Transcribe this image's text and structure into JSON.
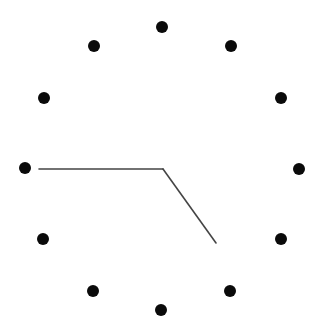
{
  "clock": {
    "description": "Analog clock face with 12 hour dots and two hands",
    "center": [
      163,
      169
    ],
    "dot_radius": 6,
    "dot_color": "#0a0a0a",
    "hand_color": "#444444",
    "hand_width": 1.6,
    "hour_dots": [
      {
        "hour": 12,
        "x": 162,
        "y": 27
      },
      {
        "hour": 1,
        "x": 231,
        "y": 46
      },
      {
        "hour": 2,
        "x": 281,
        "y": 98
      },
      {
        "hour": 3,
        "x": 299,
        "y": 169
      },
      {
        "hour": 4,
        "x": 281,
        "y": 239
      },
      {
        "hour": 5,
        "x": 230,
        "y": 291
      },
      {
        "hour": 6,
        "x": 161,
        "y": 310
      },
      {
        "hour": 7,
        "x": 93,
        "y": 291
      },
      {
        "hour": 8,
        "x": 43,
        "y": 239
      },
      {
        "hour": 9,
        "x": 25,
        "y": 168
      },
      {
        "hour": 10,
        "x": 44,
        "y": 98
      },
      {
        "hour": 11,
        "x": 94,
        "y": 46
      }
    ],
    "hands": [
      {
        "name": "minute-hand",
        "points_to": "9",
        "x2": 39,
        "y2": 169
      },
      {
        "name": "hour-hand",
        "points_to": "between 4 and 5",
        "x2": 216,
        "y2": 243
      }
    ],
    "time_shown": "4:45"
  }
}
